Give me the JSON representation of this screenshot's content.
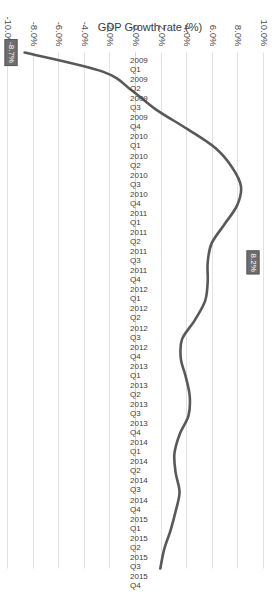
{
  "chart_data": {
    "type": "line",
    "title": "",
    "xlabel": "",
    "ylabel": "GDP Growth rate (%)",
    "ylim": [
      -10.0,
      10.0
    ],
    "grid": true,
    "legend": "none",
    "orientation": "rotated-90-clockwise",
    "series_color": "#595959",
    "categories": [
      "2009 Q1",
      "2009 Q2",
      "2009 Q3",
      "2009 Q4",
      "2010 Q1",
      "2010 Q2",
      "2010 Q3",
      "2010 Q4",
      "2011 Q1",
      "2011 Q2",
      "2011 Q3",
      "2011 Q4",
      "2012 Q1",
      "2012 Q2",
      "2012 Q3",
      "2012 Q4",
      "2013 Q1",
      "2013 Q2",
      "2013 Q3",
      "2013 Q4",
      "2014 Q1",
      "2014 Q2",
      "2014 Q3",
      "2014 Q4",
      "2015 Q1",
      "2015 Q2",
      "2015 Q3",
      "2015 Q4"
    ],
    "values": [
      -8.7,
      -2.6,
      -0.3,
      1.6,
      4.0,
      6.2,
      7.5,
      8.2,
      7.9,
      6.9,
      5.9,
      5.6,
      5.6,
      5.4,
      4.6,
      3.6,
      3.5,
      3.9,
      4.2,
      4.1,
      3.4,
      3.0,
      3.1,
      3.4,
      3.1,
      2.7,
      2.2,
      1.9
    ],
    "ytick_labels": [
      "10.0%",
      "8.0%",
      "6.0%",
      "4.0%",
      "2.0%",
      "0.0%",
      "-2.0%",
      "-4.0%",
      "-6.0%",
      "-8.0%",
      "-10.0%"
    ],
    "ytick_values": [
      10,
      8,
      6,
      4,
      2,
      0,
      -2,
      -4,
      -6,
      -8,
      -10
    ],
    "data_labels": [
      {
        "category": "2011 Q4",
        "value": 8.2,
        "text": "8.2%"
      },
      {
        "category": "2009 Q1",
        "value": -8.7,
        "text": "-8.7%"
      }
    ]
  }
}
